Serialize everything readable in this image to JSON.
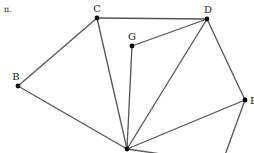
{
  "figure": {
    "label": "ii.",
    "edge_color": "#555555",
    "vertex_color": "#000000"
  },
  "vertices": [
    {
      "id": "C",
      "label": "C",
      "x": 97,
      "y": 18,
      "lx": 97,
      "ly": 12,
      "anchor": "middle"
    },
    {
      "id": "D",
      "label": "D",
      "x": 207,
      "y": 19,
      "lx": 208,
      "ly": 13,
      "anchor": "middle"
    },
    {
      "id": "G",
      "label": "G",
      "x": 132,
      "y": 46,
      "lx": 132,
      "ly": 40,
      "anchor": "middle"
    },
    {
      "id": "B",
      "label": "B",
      "x": 18,
      "y": 86,
      "lx": 16,
      "ly": 80,
      "anchor": "middle"
    },
    {
      "id": "E",
      "label": "E",
      "x": 245,
      "y": 100,
      "lx": 250,
      "ly": 104,
      "anchor": "start"
    },
    {
      "id": "A",
      "label": "",
      "x": 127,
      "y": 149,
      "lx": 127,
      "ly": 149,
      "anchor": "middle"
    }
  ],
  "edges": [
    {
      "from": "B",
      "to": "C"
    },
    {
      "from": "C",
      "to": "D"
    },
    {
      "from": "C",
      "to": "A"
    },
    {
      "from": "B",
      "to": "A"
    },
    {
      "from": "G",
      "to": "D"
    },
    {
      "from": "G",
      "to": "A"
    },
    {
      "from": "D",
      "to": "A"
    },
    {
      "from": "D",
      "to": "E"
    },
    {
      "from": "E",
      "to": "A"
    }
  ],
  "partial_edges": [
    {
      "x1": 245,
      "y1": 100,
      "x2": 225,
      "y2": 155
    },
    {
      "x1": 127,
      "y1": 149,
      "x2": 168,
      "y2": 155
    }
  ]
}
